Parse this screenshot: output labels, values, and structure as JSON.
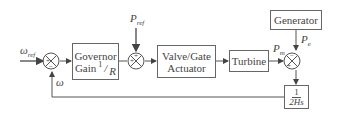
{
  "diagram": {
    "inputs": {
      "omega_ref": "ω",
      "omega_ref_sub": "ref",
      "p_ref": "P",
      "p_ref_sub": "ref"
    },
    "blocks": {
      "governor_line1": "Governor",
      "governor_line2": "Gain",
      "governor_gain_num": "1",
      "governor_gain_den": "R",
      "valve_line1": "Valve/Gate",
      "valve_line2": "Actuator",
      "turbine": "Turbine",
      "generator": "Generator",
      "inertia_num": "1",
      "inertia_den": "2Hs"
    },
    "signals": {
      "omega": "ω",
      "pm": "P",
      "pm_sub": "m",
      "pe": "P",
      "pe_sub": "e"
    },
    "summing_junctions": [
      {
        "id": "sum1",
        "signs": [
          "+",
          "−"
        ]
      },
      {
        "id": "sum2",
        "signs": [
          "+",
          "+"
        ]
      },
      {
        "id": "sum3",
        "signs": [
          "+",
          "−"
        ]
      }
    ],
    "colors": {
      "line": "#555555",
      "box_border": "#666666",
      "text": "#444444"
    }
  }
}
